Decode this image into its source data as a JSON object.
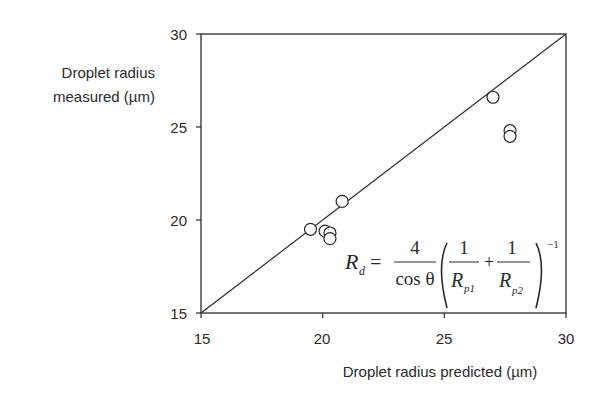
{
  "chart_data": {
    "type": "scatter",
    "title": "",
    "xlabel": "Droplet radius predicted (µm)",
    "ylabel_lines": [
      "Droplet radius",
      "measured (µm)"
    ],
    "xlim": [
      15,
      30
    ],
    "ylim": [
      15,
      30
    ],
    "xticks": [
      "15",
      "20",
      "25",
      "30"
    ],
    "yticks": [
      "15",
      "20",
      "25",
      "30"
    ],
    "grid": false,
    "legend": null,
    "series": [
      {
        "name": "measurements",
        "marker": "open-circle",
        "points": [
          {
            "x": 19.5,
            "y": 19.5
          },
          {
            "x": 20.1,
            "y": 19.4
          },
          {
            "x": 20.3,
            "y": 19.3
          },
          {
            "x": 20.3,
            "y": 19.0
          },
          {
            "x": 20.8,
            "y": 21.0
          },
          {
            "x": 27.0,
            "y": 26.6
          },
          {
            "x": 27.7,
            "y": 24.8
          },
          {
            "x": 27.7,
            "y": 24.5
          }
        ]
      }
    ],
    "reference_line": {
      "label": "y = x",
      "from": [
        15,
        15
      ],
      "to": [
        30,
        30
      ]
    },
    "annotation": {
      "formula": "R_d = 4/cos θ · (1/R_p1 + 1/R_p2)^-1",
      "lhs": "R",
      "lhs_sub": "d",
      "numerator": "4",
      "denominator": "cos θ",
      "term1_num": "1",
      "term1_den": "R",
      "term1_sub": "p1",
      "plus": "+",
      "term2_num": "1",
      "term2_den": "R",
      "term2_sub": "p2",
      "exponent": "−1"
    }
  },
  "colors": {
    "line": "#2a2a2a",
    "text": "#2a2a2a",
    "background": "#ffffff"
  }
}
